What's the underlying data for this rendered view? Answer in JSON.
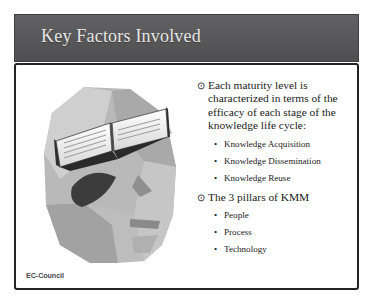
{
  "slide": {
    "title": "Key Factors Involved",
    "footer_logo": "EC-Council",
    "colors": {
      "title_bar": "#58585a",
      "title_text": "#f2f2f0",
      "body_background": "#ffffff",
      "body_border": "#242426",
      "body_text": "#1b1b1b",
      "footer_text": "#4a4a4c"
    },
    "illustration": {
      "alt": "Abstract faceted human head in profile with an open book at the top of the head",
      "name": "head-with-book-illustration"
    },
    "content": [
      {
        "glyph": "⊙",
        "text": "Each maturity level is characterized in terms of the efficacy of each stage of the knowledge life cycle:",
        "children": [
          {
            "glyph": "•",
            "text": "Knowledge Acquisition"
          },
          {
            "glyph": "•",
            "text": "Knowledge Dissemination"
          },
          {
            "glyph": "•",
            "text": "Knowledge Reuse"
          }
        ]
      },
      {
        "glyph": "⊙",
        "text": "The 3 pillars of KMM",
        "children": [
          {
            "glyph": "•",
            "text": "People"
          },
          {
            "glyph": "•",
            "text": "Process"
          },
          {
            "glyph": "•",
            "text": "Technology"
          }
        ]
      }
    ]
  }
}
